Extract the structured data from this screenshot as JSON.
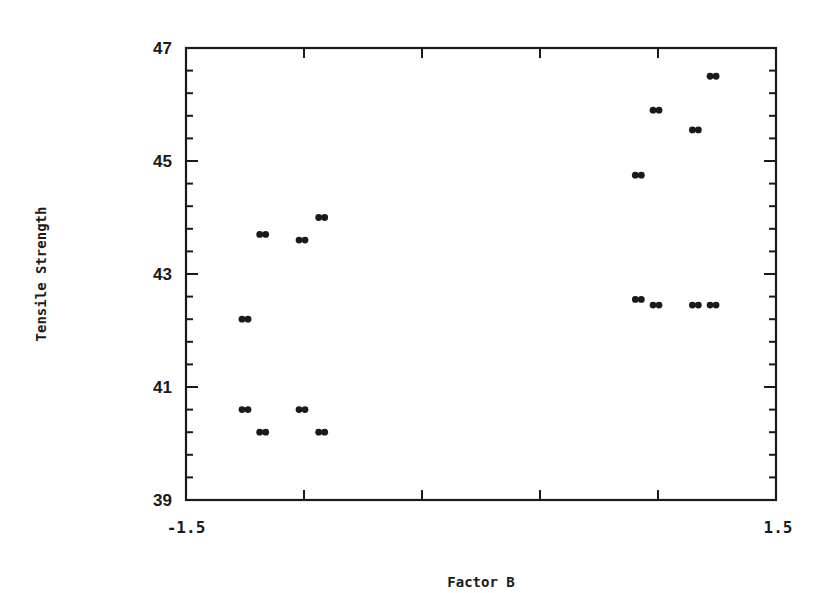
{
  "chart_data": {
    "type": "scatter",
    "title": "",
    "xlabel": "Factor B",
    "ylabel": "Tensile Strength",
    "xlim": [
      -1.5,
      1.5
    ],
    "ylim": [
      39,
      47
    ],
    "x_tick_labels": [
      "-1.5",
      "1.5"
    ],
    "x_minor_ticks": [
      -0.9,
      -0.3,
      0.3,
      0.9
    ],
    "y_tick_labels": [
      "39",
      "41",
      "43",
      "45",
      "47"
    ],
    "y_minor_tick_step": 0.4,
    "grid": false,
    "legend": null,
    "marker": "double-asterisk",
    "series": [
      {
        "name": "points",
        "points": [
          {
            "x": -1.2,
            "y": 42.2
          },
          {
            "x": -1.11,
            "y": 43.7
          },
          {
            "x": -0.91,
            "y": 43.6
          },
          {
            "x": -0.81,
            "y": 44.0
          },
          {
            "x": -1.2,
            "y": 40.6
          },
          {
            "x": -1.11,
            "y": 40.2
          },
          {
            "x": -0.91,
            "y": 40.6
          },
          {
            "x": -0.81,
            "y": 40.2
          },
          {
            "x": 0.8,
            "y": 44.75
          },
          {
            "x": 0.89,
            "y": 45.9
          },
          {
            "x": 1.09,
            "y": 45.55
          },
          {
            "x": 1.18,
            "y": 46.5
          },
          {
            "x": 0.8,
            "y": 42.55
          },
          {
            "x": 0.89,
            "y": 42.45
          },
          {
            "x": 1.09,
            "y": 42.45
          },
          {
            "x": 1.18,
            "y": 42.45
          }
        ]
      }
    ]
  },
  "axes": {
    "x_title": "Factor B",
    "y_title": "Tensile Strength",
    "x_min_label": "-1.5",
    "x_max_label": "1.5",
    "y_labels": [
      "39",
      "41",
      "43",
      "45",
      "47"
    ]
  }
}
